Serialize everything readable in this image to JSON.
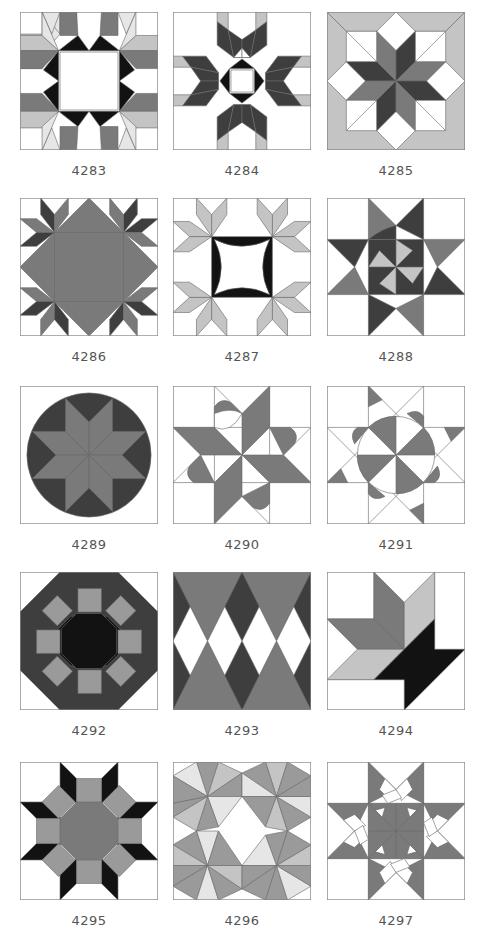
{
  "page": {
    "colors": {
      "white": "#ffffff",
      "xlight": "#e6e6e6",
      "light": "#c4c4c4",
      "gray": "#9a9a9a",
      "medium": "#7a7a7a",
      "dark": "#3e3e3e",
      "black": "#121212",
      "label": "#555555"
    }
  },
  "blocks": [
    {
      "id": "4283",
      "label": "4283"
    },
    {
      "id": "4284",
      "label": "4284"
    },
    {
      "id": "4285",
      "label": "4285"
    },
    {
      "id": "4286",
      "label": "4286"
    },
    {
      "id": "4287",
      "label": "4287"
    },
    {
      "id": "4288",
      "label": "4288"
    },
    {
      "id": "4289",
      "label": "4289"
    },
    {
      "id": "4290",
      "label": "4290"
    },
    {
      "id": "4291",
      "label": "4291"
    },
    {
      "id": "4292",
      "label": "4292"
    },
    {
      "id": "4293",
      "label": "4293"
    },
    {
      "id": "4294",
      "label": "4294"
    },
    {
      "id": "4295",
      "label": "4295"
    },
    {
      "id": "4296",
      "label": "4296"
    },
    {
      "id": "4297",
      "label": "4297"
    }
  ]
}
